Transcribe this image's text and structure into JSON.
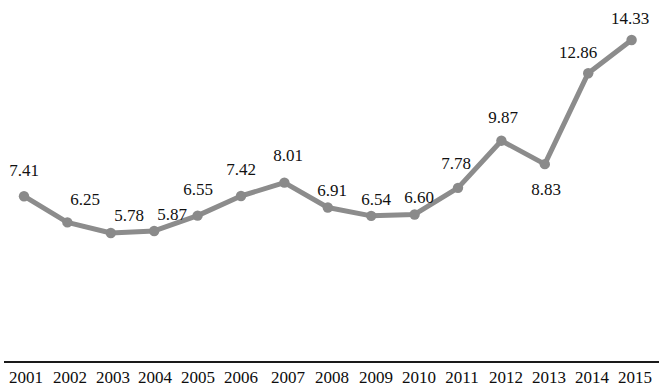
{
  "chart_data": {
    "type": "line",
    "title": "",
    "subtitle": "",
    "xlabel": "",
    "ylabel": "",
    "legend": [],
    "legend_position": "none",
    "grid": false,
    "axis": {
      "x_axis_visible": true,
      "y_axis_visible": false,
      "ylim": [
        5.0,
        15.2
      ],
      "xlim_categories": true
    },
    "categories": [
      "2001",
      "2002",
      "2003",
      "2004",
      "2005",
      "2006",
      "2007",
      "2008",
      "2009",
      "2010",
      "2011",
      "2012",
      "2013",
      "2014",
      "2015"
    ],
    "values": [
      7.41,
      6.25,
      5.78,
      5.87,
      6.55,
      7.42,
      8.01,
      6.91,
      6.54,
      6.6,
      7.78,
      9.87,
      8.83,
      12.86,
      14.33
    ],
    "point_labels": [
      "7.41",
      "6.25",
      "5.78",
      "5.87",
      "6.55",
      "7.42",
      "8.01",
      "6.91",
      "6.54",
      "6.60",
      "7.78",
      "9.87",
      "8.83",
      "12.86",
      "14.33"
    ],
    "series": [
      {
        "name": "",
        "color": "#8c8c8c",
        "marker": "circle",
        "values": [
          7.41,
          6.25,
          5.78,
          5.87,
          6.55,
          7.42,
          8.01,
          6.91,
          6.54,
          6.6,
          7.78,
          9.87,
          8.83,
          12.86,
          14.33
        ]
      }
    ]
  },
  "colors": {
    "line": "#8c8c8c",
    "marker": "#8a8a8a",
    "axis": "#1a1a1a",
    "text": "#111111",
    "background": "#ffffff"
  },
  "axis_ticks": {
    "t0": "2001",
    "t1": "2002",
    "t2": "2003",
    "t3": "2004",
    "t4": "2005",
    "t5": "2006",
    "t6": "2007",
    "t7": "2008",
    "t8": "2009",
    "t9": "2010",
    "t10": "2011",
    "t11": "2012",
    "t12": "2013",
    "t13": "2014",
    "t14": "2015"
  },
  "labels": {
    "l0": "7.41",
    "l1": "6.25",
    "l2": "5.78",
    "l3": "5.87",
    "l4": "6.55",
    "l5": "7.42",
    "l6": "8.01",
    "l7": "6.91",
    "l8": "6.54",
    "l9": "6.60",
    "l10": "7.78",
    "l11": "9.87",
    "l12": "8.83",
    "l13": "12.86",
    "l14": "14.33"
  }
}
